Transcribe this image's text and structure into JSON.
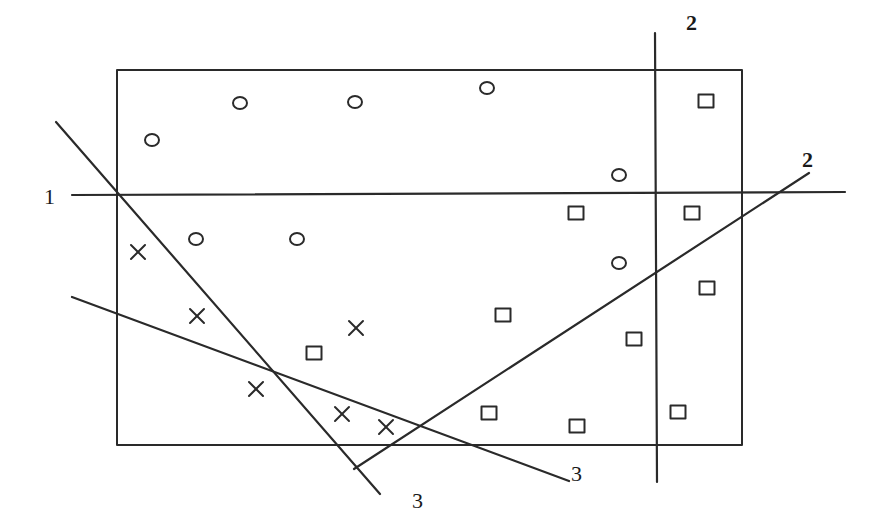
{
  "diagram": {
    "type": "decision-boundary-sketch",
    "frame": {
      "x1": 117,
      "y1": 70,
      "x2": 742,
      "y2": 445
    },
    "stroke_color": "#2a2a2a",
    "lines": [
      {
        "id": "line-1",
        "label": "1",
        "x1": 72,
        "y1": 195,
        "x2": 845,
        "y2": 192,
        "label_pos": {
          "x": 44,
          "y": 204
        },
        "label_style": "normal"
      },
      {
        "id": "line-2-vertical",
        "label": "2",
        "x1": 655,
        "y1": 33,
        "x2": 657,
        "y2": 482,
        "label_pos": {
          "x": 686,
          "y": 30
        },
        "label_style": "bold"
      },
      {
        "id": "line-2-diagonal",
        "label": "2",
        "x1": 354,
        "y1": 469,
        "x2": 809,
        "y2": 173,
        "label_pos": {
          "x": 802,
          "y": 167
        },
        "label_style": "bold"
      },
      {
        "id": "line-3-steep",
        "label": "3",
        "x1": 56,
        "y1": 122,
        "x2": 380,
        "y2": 494,
        "label_pos": {
          "x": 412,
          "y": 508
        },
        "label_style": "normal"
      },
      {
        "id": "line-3-shallow",
        "label": "3",
        "x1": 72,
        "y1": 297,
        "x2": 569,
        "y2": 481,
        "label_pos": {
          "x": 571,
          "y": 481
        },
        "label_style": "normal"
      }
    ],
    "points": {
      "circle": [
        {
          "x": 152,
          "y": 140
        },
        {
          "x": 240,
          "y": 103
        },
        {
          "x": 355,
          "y": 102
        },
        {
          "x": 487,
          "y": 88
        },
        {
          "x": 619,
          "y": 175
        },
        {
          "x": 196,
          "y": 239
        },
        {
          "x": 297,
          "y": 239
        },
        {
          "x": 619,
          "y": 263
        }
      ],
      "cross": [
        {
          "x": 138,
          "y": 252
        },
        {
          "x": 197,
          "y": 316
        },
        {
          "x": 356,
          "y": 328
        },
        {
          "x": 256,
          "y": 389
        },
        {
          "x": 342,
          "y": 414
        },
        {
          "x": 386,
          "y": 427
        }
      ],
      "square": [
        {
          "x": 706,
          "y": 101
        },
        {
          "x": 576,
          "y": 213
        },
        {
          "x": 692,
          "y": 213
        },
        {
          "x": 707,
          "y": 288
        },
        {
          "x": 503,
          "y": 315
        },
        {
          "x": 634,
          "y": 339
        },
        {
          "x": 314,
          "y": 353
        },
        {
          "x": 489,
          "y": 413
        },
        {
          "x": 577,
          "y": 426
        },
        {
          "x": 678,
          "y": 412
        }
      ]
    }
  }
}
